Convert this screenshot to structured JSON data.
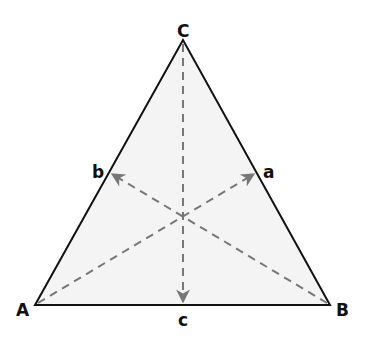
{
  "diagram": {
    "colors": {
      "fill": "#f4f4f4",
      "edge": "#111111",
      "median": "#777777",
      "label": "#111111"
    },
    "vertices": {
      "A": {
        "label": "A",
        "x": 35,
        "y": 305
      },
      "B": {
        "label": "B",
        "x": 330,
        "y": 305
      },
      "C": {
        "label": "C",
        "x": 183,
        "y": 40
      }
    },
    "midpoints": {
      "a": {
        "label": "a",
        "x": 257,
        "y": 172
      },
      "b": {
        "label": "b",
        "x": 109,
        "y": 172
      },
      "c": {
        "label": "c",
        "x": 183,
        "y": 305
      }
    },
    "medians": [
      {
        "from": "A",
        "to": "a"
      },
      {
        "from": "B",
        "to": "b"
      },
      {
        "from": "C",
        "to": "c"
      }
    ]
  }
}
